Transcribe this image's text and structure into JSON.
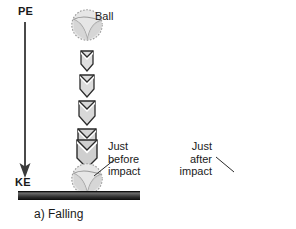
{
  "figure": {
    "background_color": "#ffffff",
    "ball_fill": "#e3e3e3",
    "ball_outline": "#8a8a8a",
    "chevron_fill": "#dcdcdc",
    "chevron_outline": "#2b2b2b",
    "ground_color": "#2a2a2a",
    "text_color": "#1a1a1a"
  },
  "panels": [
    {
      "id": "falling",
      "caption": "a) Falling",
      "axis": {
        "id": "axis-left",
        "top_label": "PE",
        "bottom_label": "KE",
        "arrow_direction": "down"
      },
      "ball_top_label": "Ball",
      "ball_bottom_label_lines": [
        "Just",
        "before",
        "impact"
      ],
      "chevron_direction": "down",
      "chevron_count": 5,
      "balls": 2
    },
    {
      "id": "rising",
      "caption": "b) Rising",
      "axis": {
        "id": "axis-right",
        "top_label": "PE",
        "bottom_label": "KE",
        "arrow_direction": "up"
      },
      "ball_top_label": "",
      "ball_bottom_label_lines": [
        "Just",
        "after",
        "impact"
      ],
      "chevron_direction": "up",
      "chevron_count": 5,
      "balls": 2
    }
  ],
  "labels": {
    "ball": "Ball",
    "pe": "PE",
    "ke": "KE",
    "just": "Just",
    "before": "before",
    "after": "after",
    "impact": "impact",
    "caption_a": "a) Falling",
    "caption_b": "b) Rising"
  }
}
